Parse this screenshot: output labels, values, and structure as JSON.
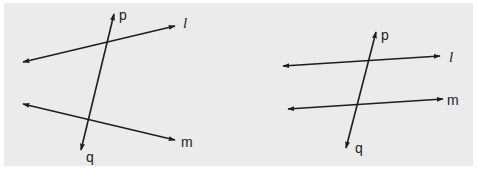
{
  "figure": {
    "background": "#ebebeb",
    "line_color": "#1e1e1e",
    "panels": [
      {
        "id": "left",
        "description": "Two non-parallel lines l and m cut by transversal pq",
        "lines": [
          {
            "name": "l",
            "x1": 23,
            "y1": 62,
            "x2": 175,
            "y2": 26,
            "label": "l",
            "label_x": 183,
            "label_y": 28
          },
          {
            "name": "m",
            "x1": 23,
            "y1": 104,
            "x2": 175,
            "y2": 140,
            "label": "m",
            "label_x": 181,
            "label_y": 147
          },
          {
            "name": "pq",
            "x1": 114,
            "y1": 14,
            "x2": 81,
            "y2": 150,
            "label_top": "p",
            "label_top_x": 119,
            "label_top_y": 20,
            "label_bottom": "q",
            "label_bottom_x": 86,
            "label_bottom_y": 162
          }
        ]
      },
      {
        "id": "right",
        "description": "Two parallel lines l and m cut by transversal pq",
        "lines": [
          {
            "name": "l",
            "x1": 283,
            "y1": 66,
            "x2": 440,
            "y2": 56,
            "label": "l",
            "label_x": 449,
            "label_y": 62
          },
          {
            "name": "m",
            "x1": 288,
            "y1": 109,
            "x2": 443,
            "y2": 99,
            "label": "m",
            "label_x": 447,
            "label_y": 105
          },
          {
            "name": "pq",
            "x1": 376,
            "y1": 32,
            "x2": 346,
            "y2": 148,
            "label_top": "p",
            "label_top_x": 381,
            "label_top_y": 40,
            "label_bottom": "q",
            "label_bottom_x": 355,
            "label_bottom_y": 153
          }
        ]
      }
    ]
  },
  "labels": {
    "left_l": "l",
    "left_m": "m",
    "left_p": "p",
    "left_q": "q",
    "right_l": "l",
    "right_m": "m",
    "right_p": "p",
    "right_q": "q"
  }
}
